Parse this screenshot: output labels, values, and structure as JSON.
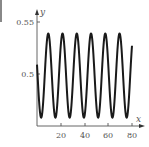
{
  "chart_data": {
    "type": "line",
    "title": "",
    "xlabel": "x",
    "ylabel": "y",
    "xlim": [
      0,
      80
    ],
    "ylim": [
      0.45,
      0.55
    ],
    "x_ticks": [
      20,
      40,
      60,
      80
    ],
    "x_tick_labels": [
      "20",
      "40",
      "60",
      "80"
    ],
    "y_ticks": [
      0.5,
      0.55
    ],
    "y_tick_labels": [
      "0.5",
      "0.55"
    ],
    "grid": false,
    "legend": null,
    "series": [
      {
        "name": "y(x)",
        "description": "sinusoidal oscillation, period about 12, amplitude about 0.04 around 0.498",
        "x": [
          0,
          3.5,
          9.5,
          15.5,
          21.5,
          27.5,
          33.5,
          39.5,
          45.5,
          51.5,
          57.5,
          63.5,
          69.5,
          75.5,
          80
        ],
        "values": [
          0.49,
          0.458,
          0.539,
          0.458,
          0.539,
          0.458,
          0.539,
          0.458,
          0.539,
          0.458,
          0.539,
          0.458,
          0.539,
          0.458,
          0.505
        ]
      }
    ],
    "color": "#1a1a1a"
  },
  "labels": {
    "x_axis": "x",
    "y_axis": "y",
    "y_top_tick": "0.55",
    "y_mid_tick": "0.5",
    "x_tick_20": "20",
    "x_tick_40": "40",
    "x_tick_60": "60",
    "x_tick_80": "80"
  }
}
